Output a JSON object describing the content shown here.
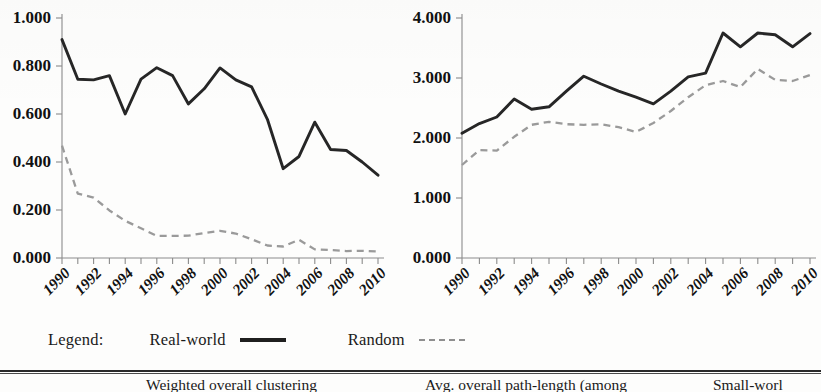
{
  "legend": {
    "title": "Legend:",
    "entries": [
      {
        "label": "Real-world",
        "style": "solid",
        "color": "#1f1f1f"
      },
      {
        "label": "Random",
        "style": "dashed",
        "color": "#8f8f8f"
      }
    ]
  },
  "table_strip": {
    "columns": [
      "Weighted overall clustering",
      "Avg. overall path-length (among",
      "Small-worl"
    ]
  },
  "chart_data": [
    {
      "id": "weighted-overall-clustering",
      "type": "line",
      "title": "",
      "xlabel": "",
      "ylabel": "",
      "grid": false,
      "legend_position": "below",
      "xlim": [
        1990,
        2010
      ],
      "ylim": [
        0.0,
        1.0
      ],
      "x": [
        1990,
        1991,
        1992,
        1993,
        1994,
        1995,
        1996,
        1997,
        1998,
        1999,
        2000,
        2001,
        2002,
        2003,
        2004,
        2005,
        2006,
        2007,
        2008,
        2009,
        2010
      ],
      "xticklabels": [
        "1990",
        "1991",
        "1992",
        "1993",
        "1994",
        "1995",
        "1996",
        "1997",
        "1998",
        "1999",
        "2000",
        "2001",
        "2002",
        "2003",
        "2004",
        "2005",
        "2006",
        "2007",
        "2008",
        "2009",
        "2010"
      ],
      "xticklabels_shown": [
        "1990",
        "1992",
        "1994",
        "1996",
        "1998",
        "2000",
        "2002",
        "2004",
        "2006",
        "2008",
        "2010"
      ],
      "yticklabels": [
        "0.000",
        "0.200",
        "0.400",
        "0.600",
        "0.800",
        "1.000"
      ],
      "yticks": [
        0.0,
        0.2,
        0.4,
        0.6,
        0.8,
        1.0
      ],
      "series": [
        {
          "name": "Real-world",
          "style": "solid",
          "color": "#262626",
          "values": [
            0.91,
            0.745,
            0.742,
            0.76,
            0.6,
            0.745,
            0.793,
            0.76,
            0.642,
            0.705,
            0.792,
            0.742,
            0.713,
            0.578,
            0.372,
            0.423,
            0.566,
            0.452,
            0.448,
            0.4,
            0.345
          ]
        },
        {
          "name": "Random",
          "style": "dashed",
          "color": "#9a9a9a",
          "values": [
            0.468,
            0.268,
            0.252,
            0.198,
            0.155,
            0.124,
            0.092,
            0.092,
            0.093,
            0.104,
            0.113,
            0.102,
            0.078,
            0.052,
            0.048,
            0.076,
            0.036,
            0.033,
            0.029,
            0.03,
            0.027
          ]
        }
      ]
    },
    {
      "id": "avg-overall-path-length",
      "type": "line",
      "title": "",
      "xlabel": "",
      "ylabel": "",
      "grid": false,
      "legend_position": "below",
      "xlim": [
        1990,
        2010
      ],
      "ylim": [
        0.0,
        4.0
      ],
      "x": [
        1990,
        1991,
        1992,
        1993,
        1994,
        1995,
        1996,
        1997,
        1998,
        1999,
        2000,
        2001,
        2002,
        2003,
        2004,
        2005,
        2006,
        2007,
        2008,
        2009,
        2010
      ],
      "xticklabels": [
        "1990",
        "1991",
        "1992",
        "1993",
        "1994",
        "1995",
        "1996",
        "1997",
        "1998",
        "1999",
        "2000",
        "2001",
        "2002",
        "2003",
        "2004",
        "2005",
        "2006",
        "2007",
        "2008",
        "2009",
        "2010"
      ],
      "xticklabels_shown": [
        "1990",
        "1992",
        "1994",
        "1996",
        "1998",
        "2000",
        "2002",
        "2004",
        "2006",
        "2008",
        "2010"
      ],
      "yticklabels": [
        "0.000",
        "1.000",
        "2.000",
        "3.000",
        "4.000"
      ],
      "yticks": [
        0.0,
        1.0,
        2.0,
        3.0,
        4.0
      ],
      "series": [
        {
          "name": "Real-world",
          "style": "solid",
          "color": "#262626",
          "values": [
            2.08,
            2.24,
            2.35,
            2.65,
            2.48,
            2.52,
            2.78,
            3.03,
            2.9,
            2.78,
            2.68,
            2.57,
            2.78,
            3.02,
            3.08,
            3.75,
            3.52,
            3.75,
            3.72,
            3.52,
            3.74
          ]
        },
        {
          "name": "Random",
          "style": "dashed",
          "color": "#9a9a9a",
          "values": [
            1.55,
            1.8,
            1.79,
            2.02,
            2.22,
            2.27,
            2.23,
            2.22,
            2.23,
            2.18,
            2.1,
            2.25,
            2.45,
            2.68,
            2.88,
            2.95,
            2.85,
            3.15,
            2.97,
            2.95,
            3.05
          ]
        }
      ]
    }
  ]
}
